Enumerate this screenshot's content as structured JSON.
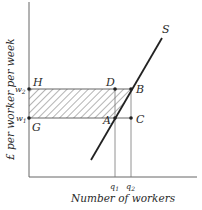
{
  "diagram": {
    "y_axis_label": "£ per worker per week",
    "x_axis_label": "Number of workers",
    "curve_label": "S",
    "y_ticks": [
      {
        "label": "w",
        "sub": "2",
        "y": 89
      },
      {
        "label": "w",
        "sub": "1",
        "y": 118
      }
    ],
    "x_ticks": [
      {
        "label": "q",
        "sub": "1",
        "x": 115
      },
      {
        "label": "q",
        "sub": "2",
        "x": 131
      }
    ],
    "points": {
      "H": "H",
      "G": "G",
      "D": "D",
      "B": "B",
      "A": "A",
      "C": "C"
    },
    "shaded_region": "rectangle G-A-D-H hatched (w1 to w2, 0 to q1) plus triangle A-B-D",
    "colors": {
      "ink": "#2a2a2a",
      "axis": "#555555",
      "background": "#ffffff"
    }
  }
}
